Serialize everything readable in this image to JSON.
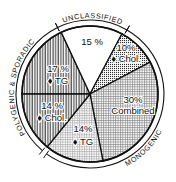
{
  "chart_data": {
    "type": "pie",
    "title": "",
    "center": [
      90,
      94
    ],
    "radius": 68,
    "outer_arc_radius": 74,
    "slices": [
      {
        "label": "17 %",
        "sublabel": "♦ TG",
        "value": 17,
        "group": "Polygenic & Sporadic",
        "start_deg": 180,
        "end_deg": 245,
        "pattern": "vlines",
        "label_pos": [
          58,
          72
        ],
        "sub_pos": [
          58,
          84
        ]
      },
      {
        "label": "15 %",
        "sublabel": "",
        "value": 15,
        "group": "Unclassified",
        "start_deg": 245,
        "end_deg": 298,
        "pattern": "white",
        "label_pos": [
          92,
          45
        ],
        "sub_pos": [
          0,
          0
        ]
      },
      {
        "label": "10%",
        "sublabel": "♦ Chol.",
        "value": 10,
        "group": "Monogenic",
        "start_deg": 298,
        "end_deg": 332,
        "pattern": "dots",
        "label_pos": [
          126,
          51
        ],
        "sub_pos": [
          126,
          62
        ]
      },
      {
        "label": "30%",
        "sublabel": "Combined",
        "value": 30,
        "group": "Monogenic",
        "start_deg": 332,
        "end_deg": 439,
        "pattern": "grid",
        "label_pos": [
          133,
          103
        ],
        "sub_pos": [
          133,
          114
        ]
      },
      {
        "label": "14%",
        "sublabel": "♦ TG",
        "value": 14,
        "group": "Monogenic",
        "start_deg": 439,
        "end_deg": 489,
        "pattern": "grid2",
        "label_pos": [
          83,
          132
        ],
        "sub_pos": [
          83,
          145
        ]
      },
      {
        "label": "14 %",
        "sublabel": "♦ Chol.",
        "value": 14,
        "group": "Polygenic & Sporadic",
        "start_deg": 489,
        "end_deg": 540,
        "pattern": "vlines",
        "label_pos": [
          52,
          109
        ],
        "sub_pos": [
          52,
          121
        ]
      }
    ],
    "groups": [
      {
        "name": "UNCLASSIFIED",
        "start_deg": 244,
        "end_deg": 300
      },
      {
        "name": "MONOGENIC",
        "start_deg": 300,
        "end_deg": 486
      },
      {
        "name": "POLYGENIC & SPORADIC",
        "start_deg": 130,
        "end_deg": 244
      }
    ],
    "legend": "none",
    "grid": false
  },
  "labels": {
    "unclassified": "UNCLASSIFIED",
    "monogenic": "MONOGENIC",
    "polygenic": "POLYGENIC & SPORADIC"
  },
  "colors": {
    "ink": "#111111",
    "paper": "#ffffff"
  }
}
